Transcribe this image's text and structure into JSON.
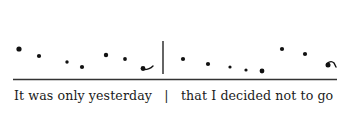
{
  "diagram": {
    "type": "intonation-contour",
    "ink_color": "#111111",
    "baseline": {
      "x1": 13,
      "x2": 337,
      "y": 79.5
    },
    "boundary_bar": {
      "x": 163,
      "y1": 41,
      "y2": 74
    },
    "syllables": [
      {
        "x": 19,
        "y": 49,
        "r": 2.6,
        "kind": "stressed"
      },
      {
        "x": 39,
        "y": 56,
        "r": 2.1,
        "kind": "unstressed"
      },
      {
        "x": 67,
        "y": 62,
        "r": 1.7,
        "kind": "unstressed"
      },
      {
        "x": 82,
        "y": 67,
        "r": 2.1,
        "kind": "unstressed"
      },
      {
        "x": 106,
        "y": 55,
        "r": 2.2,
        "kind": "stressed"
      },
      {
        "x": 125,
        "y": 59,
        "r": 1.9,
        "kind": "unstressed"
      },
      {
        "x": 143,
        "y": 68.5,
        "r": 2.4,
        "kind": "nucleus-fall-rise"
      },
      {
        "x": 183,
        "y": 59,
        "r": 2.1,
        "kind": "stressed"
      },
      {
        "x": 208,
        "y": 64,
        "r": 2.1,
        "kind": "unstressed"
      },
      {
        "x": 230,
        "y": 67,
        "r": 1.6,
        "kind": "unstressed"
      },
      {
        "x": 246,
        "y": 70,
        "r": 1.6,
        "kind": "unstressed"
      },
      {
        "x": 262,
        "y": 71,
        "r": 2.4,
        "kind": "unstressed"
      },
      {
        "x": 282,
        "y": 49,
        "r": 2.1,
        "kind": "stressed"
      },
      {
        "x": 305,
        "y": 54,
        "r": 2.1,
        "kind": "stressed"
      },
      {
        "x": 328,
        "y": 65,
        "r": 2.5,
        "kind": "nucleus-rise-fall"
      }
    ],
    "tone_tails": [
      {
        "name": "rising-tail",
        "d": "M143,69.5 Q149,70 153,66"
      },
      {
        "name": "rise-fall-tail",
        "d": "M327,63.5 Q331,60 334,63 L336,67"
      }
    ]
  },
  "caption": {
    "phrase1": "It was only yesterday",
    "separator": "|",
    "phrase2": "that I decided not to go"
  }
}
